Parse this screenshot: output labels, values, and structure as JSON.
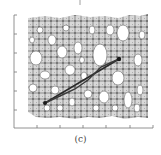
{
  "figure": {
    "panel_label": "(c)",
    "colors": {
      "axis": "#777777",
      "network": "#9a9a9a",
      "network_dark": "#666666",
      "path": "#2a2a2a",
      "background": "#ffffff"
    },
    "axes": {
      "x_ticks_count": 6,
      "y_ticks_count": 6,
      "tick_labels_visible": false
    },
    "path": {
      "start": [
        45,
        103
      ],
      "end": [
        119,
        59
      ],
      "types": [
        "straight-line",
        "tortuous-path"
      ]
    }
  }
}
